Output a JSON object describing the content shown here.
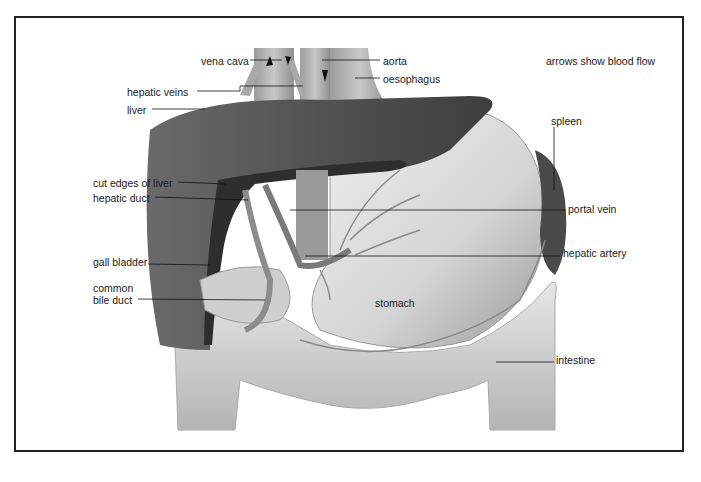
{
  "figure": {
    "note": "arrows show blood flow",
    "labels": {
      "vena_cava": "vena cava",
      "aorta": "aorta",
      "oesophagus": "oesophagus",
      "hepatic_veins": "hepatic veins",
      "liver": "liver",
      "spleen": "spleen",
      "cut_edges_of_liver": "cut edges of liver",
      "hepatic_duct": "hepatic duct",
      "portal_vein": "portal vein",
      "hepatic_artery": "hepatic artery",
      "gall_bladder": "gall bladder",
      "common_bile_duct_1": "common",
      "common_bile_duct_2": "bile duct",
      "stomach": "stomach",
      "intestine": "intestine"
    },
    "colors": {
      "frame": "#222222",
      "liver": "#5a5a5a",
      "liver_cut": "#2e2e2e",
      "stomach": "#d9d9d9",
      "intestine": "#cfcfcf",
      "vessels": "#8a8a8a",
      "label_text": "#1a1a1a"
    }
  }
}
